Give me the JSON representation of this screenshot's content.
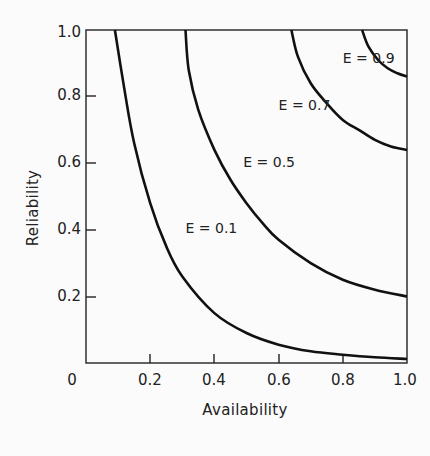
{
  "chart_data": {
    "type": "line",
    "title": "",
    "xlabel": "Availability",
    "ylabel": "Reliability",
    "xlim": [
      0,
      1.0
    ],
    "ylim": [
      0,
      1.0
    ],
    "grid": false,
    "legend": "inline curve labels",
    "x_ticks": [
      "0",
      "0.2",
      "0.4",
      "0.6",
      "0.8",
      "1.0"
    ],
    "y_ticks": [
      "0.2",
      "0.4",
      "0.6",
      "0.8",
      "1.0"
    ],
    "series": [
      {
        "name": "E = 0.1",
        "x": [
          0.09,
          0.12,
          0.15,
          0.2,
          0.25,
          0.3,
          0.4,
          0.5,
          0.6,
          0.7,
          0.8,
          0.9,
          1.0
        ],
        "y": [
          1.0,
          0.82,
          0.66,
          0.48,
          0.35,
          0.26,
          0.15,
          0.09,
          0.055,
          0.035,
          0.025,
          0.017,
          0.012
        ]
      },
      {
        "name": "E = 0.5",
        "x": [
          0.31,
          0.32,
          0.35,
          0.4,
          0.45,
          0.5,
          0.55,
          0.6,
          0.7,
          0.8,
          0.9,
          1.0
        ],
        "y": [
          1.0,
          0.88,
          0.76,
          0.64,
          0.55,
          0.48,
          0.42,
          0.37,
          0.3,
          0.25,
          0.22,
          0.2
        ]
      },
      {
        "name": "E = 0.7",
        "x": [
          0.64,
          0.66,
          0.7,
          0.75,
          0.8,
          0.85,
          0.9,
          0.95,
          1.0
        ],
        "y": [
          1.0,
          0.92,
          0.84,
          0.78,
          0.73,
          0.7,
          0.67,
          0.65,
          0.64
        ]
      },
      {
        "name": "E = 0.9",
        "x": [
          0.86,
          0.88,
          0.91,
          0.94,
          0.97,
          1.0
        ],
        "y": [
          1.0,
          0.95,
          0.91,
          0.885,
          0.87,
          0.86
        ]
      }
    ],
    "annotations": [
      {
        "text": "E = 0.1",
        "x": 0.31,
        "y": 0.39
      },
      {
        "text": "E = 0.5",
        "x": 0.49,
        "y": 0.59
      },
      {
        "text": "E = 0.7",
        "x": 0.6,
        "y": 0.76
      },
      {
        "text": "E = 0.9",
        "x": 0.8,
        "y": 0.9
      }
    ]
  },
  "labels": {
    "xlabel": "Availability",
    "ylabel": "Reliability",
    "origin": "0",
    "x_ticks": [
      "0.2",
      "0.4",
      "0.6",
      "0.8",
      "1.0"
    ],
    "y_ticks": [
      "0.2",
      "0.4",
      "0.6",
      "0.8",
      "1.0"
    ],
    "curves": [
      "E = 0.1",
      "E = 0.5",
      "E = 0.7",
      "E = 0.9"
    ]
  }
}
